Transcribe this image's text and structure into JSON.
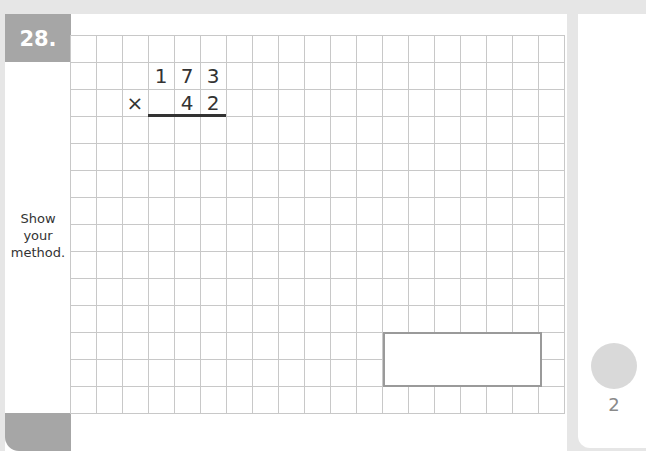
{
  "question": {
    "number_label": "28.",
    "instruction_lines": [
      "Show",
      "your",
      "method."
    ]
  },
  "calculation": {
    "top_row": [
      "1",
      "7",
      "3"
    ],
    "operator": "×",
    "bottom_row": [
      "4",
      "2"
    ]
  },
  "answer": {
    "value": ""
  },
  "marks": {
    "value": "2"
  },
  "colors": {
    "label_gray": "#a6a6a6",
    "grid_line": "#c8c8c8",
    "background": "#e6e6e6",
    "answer_border": "#9a9a9a",
    "marks_circle": "#d9d9d9"
  }
}
